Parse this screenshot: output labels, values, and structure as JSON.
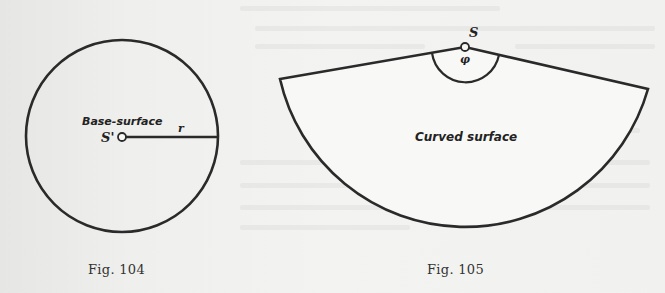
{
  "figures": [
    {
      "id": "fig104",
      "caption": "Fig. 104",
      "shape": "circle",
      "labels": {
        "region": "Base-surface",
        "center_point": "S'",
        "radius": "r"
      },
      "geometry": {
        "cx": 122,
        "cy": 136,
        "r": 96
      }
    },
    {
      "id": "fig105",
      "caption": "Fig. 105",
      "shape": "sector",
      "labels": {
        "region": "Curved surface",
        "apex_point": "S",
        "angle": "φ"
      },
      "geometry": {
        "apex": [
          465,
          47
        ],
        "left_corner": [
          280,
          79
        ],
        "right_corner": [
          648,
          89
        ],
        "radius": 190
      }
    }
  ],
  "colors": {
    "ink": "#2a2a2a",
    "paper": "#f0f0ee"
  }
}
